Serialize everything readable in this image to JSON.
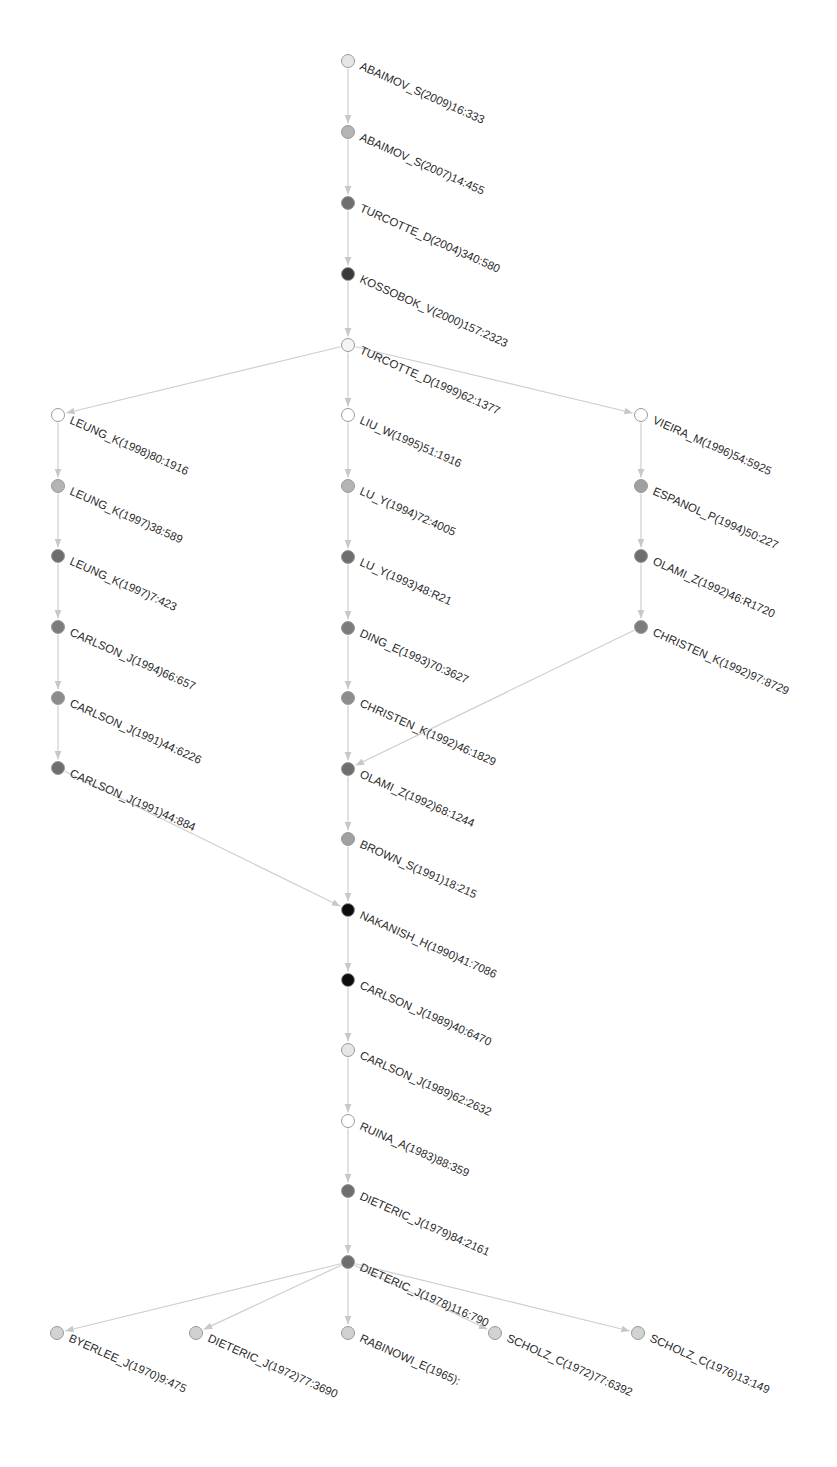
{
  "diagram": {
    "type": "citation-main-path-graph",
    "colors": {
      "edge": "#cfcfcf",
      "label": "#2a2a2a",
      "shade_white": "#ffffff",
      "shade_lightest": "#e6e6e6",
      "shade_light": "#b4b4b4",
      "shade_mid": "#8c8c8c",
      "shade_dark": "#6e6e6e",
      "shade_darker": "#3a3a3a",
      "shade_black": "#0d0d0d"
    },
    "nodes": [
      {
        "id": "n1",
        "label": "ABAIMOV_S(2009)16:333",
        "x": 348,
        "y": 61,
        "fill": "#e6e6e6"
      },
      {
        "id": "n2",
        "label": "ABAIMOV_S(2007)14:455",
        "x": 348,
        "y": 132,
        "fill": "#b4b4b4"
      },
      {
        "id": "n3",
        "label": "TURCOTTE_D(2004)340:580",
        "x": 348,
        "y": 203,
        "fill": "#6e6e6e"
      },
      {
        "id": "n4",
        "label": "KOSSOBOK_V(2000)157:2323",
        "x": 348,
        "y": 274,
        "fill": "#3a3a3a"
      },
      {
        "id": "n5",
        "label": "TURCOTTE_D(1999)62:1377",
        "x": 348,
        "y": 345,
        "fill": "#f4f4f4"
      },
      {
        "id": "n6",
        "label": "LIU_W(1995)51:1916",
        "x": 348,
        "y": 415,
        "fill": "#ffffff"
      },
      {
        "id": "n7",
        "label": "LU_Y(1994)72:4005",
        "x": 348,
        "y": 486,
        "fill": "#b4b4b4"
      },
      {
        "id": "n8",
        "label": "LU_Y(1993)48:R21",
        "x": 348,
        "y": 557,
        "fill": "#6e6e6e"
      },
      {
        "id": "n9",
        "label": "DING_E(1993)70:3627",
        "x": 348,
        "y": 628,
        "fill": "#7c7c7c"
      },
      {
        "id": "n10",
        "label": "CHRISTEN_K(1992)46:1829",
        "x": 348,
        "y": 698,
        "fill": "#8c8c8c"
      },
      {
        "id": "n11",
        "label": "OLAMI_Z(1992)68:1244",
        "x": 348,
        "y": 769,
        "fill": "#6e6e6e"
      },
      {
        "id": "n12",
        "label": "BROWN_S(1991)18:215",
        "x": 348,
        "y": 839,
        "fill": "#a0a0a0"
      },
      {
        "id": "n13",
        "label": "NAKANISH_H(1990)41:7086",
        "x": 348,
        "y": 910,
        "fill": "#0d0d0d"
      },
      {
        "id": "n14",
        "label": "CARLSON_J(1989)40:6470",
        "x": 348,
        "y": 980,
        "fill": "#0d0d0d"
      },
      {
        "id": "n15",
        "label": "CARLSON_J(1989)62:2632",
        "x": 348,
        "y": 1050,
        "fill": "#e6e6e6"
      },
      {
        "id": "n16",
        "label": "RUINA_A(1983)88:359",
        "x": 348,
        "y": 1121,
        "fill": "#ffffff"
      },
      {
        "id": "n17",
        "label": "DIETERIC_J(1979)84:2161",
        "x": 348,
        "y": 1191,
        "fill": "#6e6e6e"
      },
      {
        "id": "n18",
        "label": "DIETERIC_J(1978)116:790",
        "x": 348,
        "y": 1262,
        "fill": "#6e6e6e"
      },
      {
        "id": "n19",
        "label": "RABINOWI_E(1965):",
        "x": 348,
        "y": 1333,
        "fill": "#d2d2d2"
      },
      {
        "id": "l1",
        "label": "LEUNG_K(1998)80:1916",
        "x": 58,
        "y": 415,
        "fill": "#ffffff"
      },
      {
        "id": "l2",
        "label": "LEUNG_K(1997)38:589",
        "x": 58,
        "y": 486,
        "fill": "#b4b4b4"
      },
      {
        "id": "l3",
        "label": "LEUNG_K(1997)7:423",
        "x": 58,
        "y": 556,
        "fill": "#6e6e6e"
      },
      {
        "id": "l4",
        "label": "CARLSON_J(1994)66:657",
        "x": 58,
        "y": 627,
        "fill": "#7c7c7c"
      },
      {
        "id": "l5",
        "label": "CARLSON_J(1991)44:6226",
        "x": 58,
        "y": 698,
        "fill": "#8c8c8c"
      },
      {
        "id": "l6",
        "label": "CARLSON_J(1991)44:884",
        "x": 58,
        "y": 768,
        "fill": "#6e6e6e"
      },
      {
        "id": "r1",
        "label": "VIEIRA_M(1996)54:5925",
        "x": 641,
        "y": 415,
        "fill": "#ffffff"
      },
      {
        "id": "r2",
        "label": "ESPANOL_P(1994)50:227",
        "x": 641,
        "y": 486,
        "fill": "#a0a0a0"
      },
      {
        "id": "r3",
        "label": "OLAMI_Z(1992)46:R1720",
        "x": 641,
        "y": 556,
        "fill": "#6e6e6e"
      },
      {
        "id": "r4",
        "label": "CHRISTEN_K(1992)97:8729",
        "x": 641,
        "y": 627,
        "fill": "#7c7c7c"
      },
      {
        "id": "b1",
        "label": "BYERLEE_J(1970)9:475",
        "x": 57,
        "y": 1333,
        "fill": "#d2d2d2"
      },
      {
        "id": "b2",
        "label": "DIETERIC_J(1972)77:3690",
        "x": 196,
        "y": 1333,
        "fill": "#d2d2d2"
      },
      {
        "id": "b4",
        "label": "SCHOLZ_C(1972)77:6392",
        "x": 495,
        "y": 1333,
        "fill": "#d2d2d2"
      },
      {
        "id": "b5",
        "label": "SCHOLZ_C(1976)13:149",
        "x": 638,
        "y": 1333,
        "fill": "#d2d2d2"
      }
    ],
    "edges": [
      {
        "from": "n1",
        "to": "n2"
      },
      {
        "from": "n2",
        "to": "n3"
      },
      {
        "from": "n3",
        "to": "n4"
      },
      {
        "from": "n4",
        "to": "n5"
      },
      {
        "from": "n5",
        "to": "n6"
      },
      {
        "from": "n6",
        "to": "n7"
      },
      {
        "from": "n7",
        "to": "n8"
      },
      {
        "from": "n8",
        "to": "n9"
      },
      {
        "from": "n9",
        "to": "n10"
      },
      {
        "from": "n10",
        "to": "n11"
      },
      {
        "from": "n11",
        "to": "n12"
      },
      {
        "from": "n12",
        "to": "n13"
      },
      {
        "from": "n13",
        "to": "n14"
      },
      {
        "from": "n14",
        "to": "n15"
      },
      {
        "from": "n15",
        "to": "n16"
      },
      {
        "from": "n16",
        "to": "n17"
      },
      {
        "from": "n17",
        "to": "n18"
      },
      {
        "from": "n18",
        "to": "n19"
      },
      {
        "from": "n5",
        "to": "l1"
      },
      {
        "from": "l1",
        "to": "l2"
      },
      {
        "from": "l2",
        "to": "l3"
      },
      {
        "from": "l3",
        "to": "l4"
      },
      {
        "from": "l4",
        "to": "l5"
      },
      {
        "from": "l5",
        "to": "l6"
      },
      {
        "from": "l6",
        "to": "n13"
      },
      {
        "from": "n5",
        "to": "r1"
      },
      {
        "from": "r1",
        "to": "r2"
      },
      {
        "from": "r2",
        "to": "r3"
      },
      {
        "from": "r3",
        "to": "r4"
      },
      {
        "from": "r4",
        "to": "n11"
      },
      {
        "from": "n18",
        "to": "b1"
      },
      {
        "from": "n18",
        "to": "b2"
      },
      {
        "from": "n18",
        "to": "b4"
      },
      {
        "from": "n18",
        "to": "b5"
      }
    ]
  }
}
